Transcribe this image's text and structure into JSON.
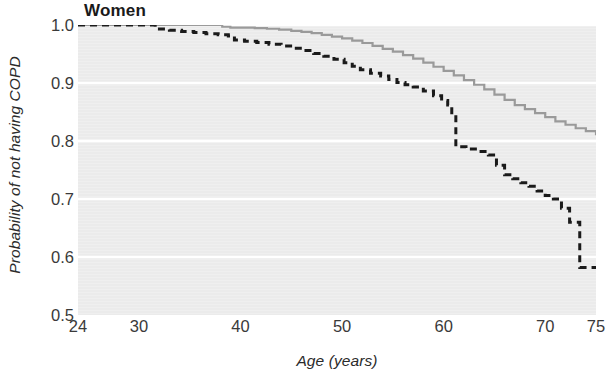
{
  "chart_data": {
    "type": "line",
    "title": "Women",
    "xlabel": "Age (years)",
    "ylabel": "Probability of not having COPD",
    "xlim": [
      24,
      75
    ],
    "ylim": [
      0.5,
      1.0
    ],
    "xticks": [
      24,
      30,
      40,
      50,
      60,
      70,
      75
    ],
    "xtick_labels": [
      "24",
      "30",
      "40",
      "50",
      "60",
      "70",
      "75"
    ],
    "yticks": [
      0.5,
      0.6,
      0.7,
      0.8,
      0.9,
      1.0
    ],
    "ytick_labels": [
      "0.5",
      "0.6",
      "0.7",
      "0.8",
      "0.9",
      "1.0"
    ],
    "grid": true,
    "grid_color": "#ffffff",
    "plot_background": "#ebebeb",
    "legend": null,
    "series": [
      {
        "name": "non-smokers",
        "style": "solid",
        "color": "#9a9a9a",
        "line_width": 2.2,
        "step": "post",
        "x": [
          24,
          30,
          32,
          35,
          37,
          38.2,
          39.0,
          40.2,
          41.4,
          42.6,
          43.8,
          45.0,
          46.0,
          47.0,
          48.0,
          49.0,
          50.0,
          51.0,
          52.0,
          53.0,
          54.0,
          55.0,
          56.0,
          57.0,
          58.0,
          59.0,
          60.0,
          61.0,
          62.0,
          63.0,
          64.0,
          65.0,
          66.0,
          67.0,
          68.0,
          69.0,
          70.0,
          71.0,
          72.0,
          73.0,
          74.0,
          75.0
        ],
        "y": [
          1.0,
          1.0,
          1.0,
          1.0,
          1.0,
          0.997,
          0.9955,
          0.9955,
          0.9945,
          0.9935,
          0.992,
          0.99,
          0.988,
          0.986,
          0.983,
          0.98,
          0.977,
          0.973,
          0.969,
          0.964,
          0.959,
          0.954,
          0.948,
          0.942,
          0.935,
          0.928,
          0.921,
          0.913,
          0.905,
          0.897,
          0.889,
          0.88,
          0.871,
          0.862,
          0.855,
          0.848,
          0.841,
          0.834,
          0.828,
          0.822,
          0.817,
          0.812
        ]
      },
      {
        "name": "smokers",
        "style": "dashed",
        "color": "#1a1a1a",
        "line_width": 3.0,
        "dash_pattern": "7,5",
        "step": "post",
        "x": [
          24,
          30.0,
          31.0,
          31.6,
          33.0,
          34.2,
          35.4,
          36.6,
          37.8,
          38.8,
          39.4,
          40.4,
          41.6,
          42.8,
          44.0,
          45.2,
          46.2,
          47.2,
          48.2,
          49.2,
          50.2,
          51.0,
          51.8,
          52.8,
          53.8,
          54.6,
          55.4,
          56.2,
          57.0,
          58.0,
          59.0,
          59.8,
          60.4,
          60.8,
          61.2,
          62.2,
          63.4,
          64.4,
          65.2,
          66.0,
          66.8,
          67.6,
          68.4,
          69.2,
          70.0,
          70.8,
          71.6,
          72.4,
          73.4,
          75.0
        ],
        "y": [
          1.0,
          1.0,
          1.0,
          0.993,
          0.991,
          0.989,
          0.987,
          0.985,
          0.983,
          0.981,
          0.974,
          0.972,
          0.97,
          0.967,
          0.964,
          0.96,
          0.956,
          0.951,
          0.946,
          0.941,
          0.935,
          0.929,
          0.923,
          0.917,
          0.912,
          0.906,
          0.901,
          0.897,
          0.893,
          0.886,
          0.878,
          0.87,
          0.862,
          0.845,
          0.79,
          0.786,
          0.782,
          0.776,
          0.758,
          0.742,
          0.735,
          0.728,
          0.722,
          0.714,
          0.706,
          0.7,
          0.684,
          0.66,
          0.582,
          0.582
        ]
      }
    ]
  }
}
